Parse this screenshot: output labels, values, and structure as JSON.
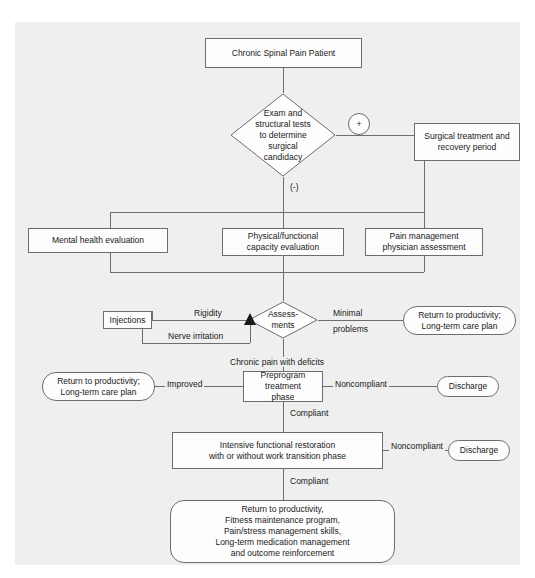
{
  "diagram": {
    "colors": {
      "panel_background": "#efefef",
      "node_fill": "#fdfdfd",
      "node_border": "#6d6d6d",
      "text": "#1a1a1a"
    },
    "nodes": {
      "start": "Chronic Spinal Pain Patient",
      "surgical_decision": "Exam and structural tests to determine surgical candidacy",
      "surgical_decision_lines": [
        "Exam and",
        "structural tests",
        "to determine",
        "surgical",
        "candidacy"
      ],
      "plus_marker": "+",
      "minus_marker": "(-)",
      "surgical_treatment": "Surgical treatment and recovery period",
      "surgical_treatment_lines": [
        "Surgical treatment and",
        "recovery period"
      ],
      "mental_health": "Mental health evaluation",
      "physical_capacity": "Physical/functional capacity evaluation",
      "physical_capacity_lines": [
        "Physical/functional",
        "capacity evaluation"
      ],
      "pain_management": "Pain management physician assessment",
      "pain_management_lines": [
        "Pain management",
        "physician assessment"
      ],
      "assessments": "Assessments",
      "assessments_lines": [
        "Assess-",
        "ments"
      ],
      "injections": "Injections",
      "return_productivity_1": "Return to productivity; Long-term care plan",
      "return_productivity_1_lines": [
        "Return to productivity;",
        "Long-term care plan"
      ],
      "return_productivity_2": "Return to productivity; Long-term care plan",
      "return_productivity_2_lines": [
        "Return to productivity;",
        "Long-term care plan"
      ],
      "preprogram": "Preprogram treatment phase",
      "preprogram_lines": [
        "Preprogram treatment",
        "phase"
      ],
      "discharge_1": "Discharge",
      "intensive_restoration": "Intensive functional restoration with or without work transition phase",
      "intensive_restoration_lines": [
        "Intensive functional restoration",
        "with or without work transition phase"
      ],
      "discharge_2": "Discharge",
      "final_outcome": "Return to productivity, Fitness maintenance program, Pain/stress management skills, Long-term medication management and outcome reinforcement",
      "final_outcome_lines": [
        "Return to productivity,",
        "Fitness maintenance program,",
        "Pain/stress management skills,",
        "Long-term medication management",
        "and outcome reinforcement"
      ]
    },
    "edge_labels": {
      "rigidity": "Rigidity",
      "nerve_irritation": "Nerve irritation",
      "minimal": "Minimal",
      "problems": "problems",
      "chronic_pain_deficits": "Chronic pain with deficits",
      "improved": "Improved",
      "noncompliant_1": "Noncompliant",
      "compliant_1": "Compliant",
      "noncompliant_2": "Noncompliant",
      "compliant_2": "Compliant"
    }
  }
}
